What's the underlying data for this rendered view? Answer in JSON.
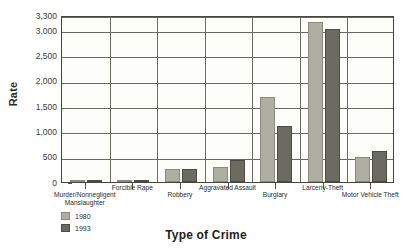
{
  "chart_data": {
    "type": "bar",
    "title": "",
    "xlabel": "Type of Crime",
    "ylabel": "Rate",
    "ylim": [
      0,
      3300
    ],
    "grid": true,
    "legend_position": "bottom-left",
    "categories": [
      "Murder/Nonnegligent\nManslaughter",
      "Forcible Rape",
      "Robbery",
      "Aggravated Assault",
      "Burglary",
      "Larceny-Theft",
      "Motor Vehicle Theft"
    ],
    "ytick_labels": [
      "0",
      "500",
      "1,000",
      "1,500",
      "2,000",
      "2,500",
      "3,000",
      "3,300"
    ],
    "ytick_values": [
      0,
      500,
      1000,
      1500,
      2000,
      2500,
      3000,
      3300
    ],
    "series": [
      {
        "name": "1980",
        "color": "#aeaea2",
        "values": [
          10,
          37,
          251,
          299,
          1684,
          3167,
          502
        ]
      },
      {
        "name": "1993",
        "color": "#6b6b62",
        "values": [
          10,
          41,
          256,
          440,
          1100,
          3033,
          606
        ]
      }
    ]
  },
  "legend": {
    "items": [
      {
        "label": "1980",
        "color": "#aeaea2"
      },
      {
        "label": "1993",
        "color": "#6b6b62"
      }
    ]
  },
  "axes": {
    "y_title": "Rate",
    "x_title": "Type of Crime"
  }
}
